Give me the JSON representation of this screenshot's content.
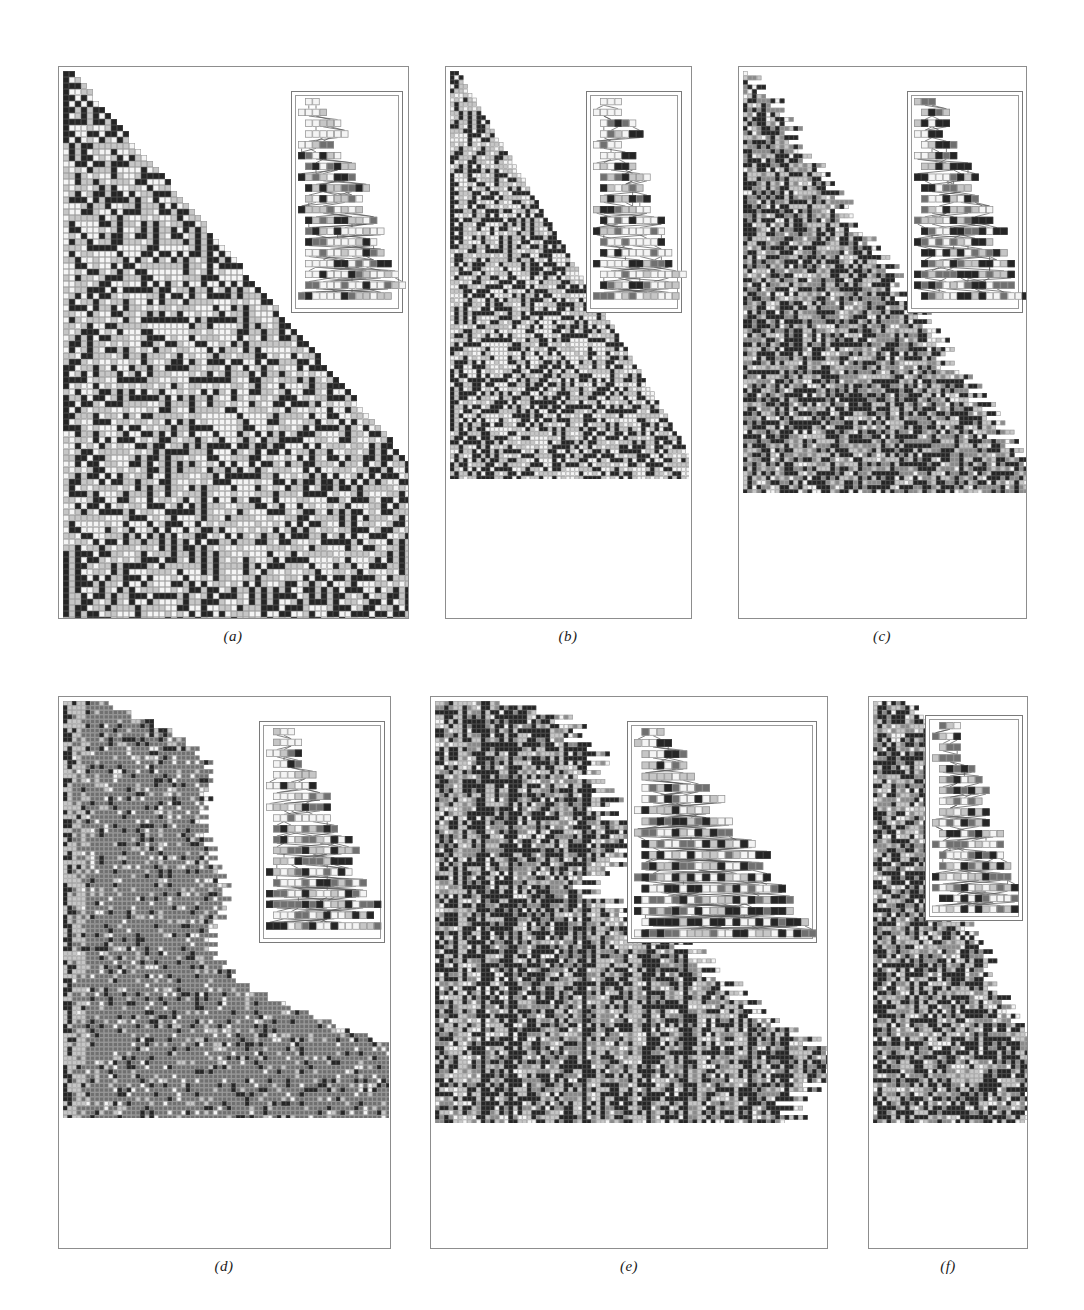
{
  "figure": {
    "background_color": "#ffffff",
    "panel_count": 6,
    "layout": "2 rows x 3 columns",
    "frame_color": "#8d8d8d"
  },
  "palette": {
    "state_white": "#f4f4f4",
    "state_light": "#c6c6c6",
    "state_mid": "#707070",
    "state_dark": "#8a8a8a",
    "state_black": "#252525",
    "cell_border": "#9e9e9e",
    "inset_link": "#5a5a5a"
  },
  "panels": [
    {
      "id": "a",
      "caption": "(a)",
      "x": 58,
      "y": 66,
      "w": 351,
      "h": 553,
      "grid": {
        "cols": 76,
        "rows": 92,
        "cell": 6.0,
        "origin_x": 4,
        "origin_y": 4
      },
      "boundary": "right-triangular",
      "slope": 0.6,
      "seed": 11731,
      "weights": {
        "white": 0.34,
        "light": 0.33,
        "black": 0.33
      },
      "structure": "nested-fractal",
      "inset": {
        "x": 232,
        "y": 24,
        "w": 112,
        "h": 222,
        "cols": 14,
        "rows": 19,
        "cell": 7.2,
        "seed": 4027,
        "links": true,
        "weights": {
          "white": 0.45,
          "light": 0.25,
          "mid": 0.15,
          "black": 0.15
        }
      }
    },
    {
      "id": "b",
      "caption": "(b)",
      "x": 445,
      "y": 66,
      "w": 247,
      "h": 553,
      "grid": {
        "cols": 54,
        "rows": 92,
        "cell": 4.45,
        "origin_x": 4,
        "origin_y": 4
      },
      "boundary": "right-triangular",
      "slope": 0.54,
      "seed": 22817,
      "weights": {
        "white": 0.33,
        "light": 0.34,
        "black": 0.33
      },
      "structure": "triangle-clusters",
      "inset": {
        "x": 140,
        "y": 24,
        "w": 96,
        "h": 222,
        "cols": 12,
        "rows": 19,
        "cell": 7.2,
        "seed": 5519,
        "links": true,
        "weights": {
          "white": 0.42,
          "light": 0.26,
          "mid": 0.16,
          "black": 0.16
        }
      }
    },
    {
      "id": "c",
      "caption": "(c)",
      "x": 738,
      "y": 66,
      "w": 289,
      "h": 553,
      "grid": {
        "cols": 62,
        "rows": 92,
        "cell": 4.6,
        "origin_x": 4,
        "origin_y": 4
      },
      "boundary": "ragged-triangular",
      "slope": 0.62,
      "seed": 33911,
      "weights": {
        "white": 0.1,
        "light": 0.22,
        "dark": 0.28,
        "black": 0.4
      },
      "structure": "dense-chaotic",
      "inset": {
        "x": 168,
        "y": 24,
        "w": 116,
        "h": 222,
        "cols": 15,
        "rows": 19,
        "cell": 7.2,
        "seed": 6203,
        "links": true,
        "weights": {
          "white": 0.22,
          "light": 0.24,
          "mid": 0.24,
          "black": 0.3
        }
      }
    },
    {
      "id": "d",
      "caption": "(d)",
      "x": 58,
      "y": 696,
      "w": 333,
      "h": 553,
      "grid": {
        "cols": 72,
        "rows": 92,
        "cell": 4.55,
        "origin_x": 4,
        "origin_y": 4
      },
      "boundary": "bulging-lobed",
      "slope": 0.72,
      "seed": 44013,
      "weights": {
        "white": 0.07,
        "light": 0.09,
        "mid": 0.72,
        "black": 0.12
      },
      "structure": "solid-gray-lobes",
      "inset": {
        "x": 200,
        "y": 24,
        "w": 126,
        "h": 222,
        "cols": 16,
        "rows": 19,
        "cell": 7.2,
        "seed": 7307,
        "links": true,
        "weights": {
          "white": 0.4,
          "light": 0.24,
          "mid": 0.18,
          "black": 0.18
        }
      }
    },
    {
      "id": "e",
      "caption": "(e)",
      "x": 430,
      "y": 696,
      "w": 398,
      "h": 553,
      "grid": {
        "cols": 86,
        "rows": 92,
        "cell": 4.6,
        "origin_x": 4,
        "origin_y": 4
      },
      "boundary": "ragged-columnar",
      "slope": 0.8,
      "seed": 55127,
      "weights": {
        "white": 0.13,
        "light": 0.21,
        "dark": 0.26,
        "black": 0.4
      },
      "structure": "vertical-striped-chaotic",
      "inset": {
        "x": 196,
        "y": 24,
        "w": 190,
        "h": 222,
        "cols": 24,
        "rows": 19,
        "cell": 7.6,
        "seed": 8419,
        "links": true,
        "weights": {
          "white": 0.26,
          "light": 0.24,
          "mid": 0.22,
          "black": 0.28
        }
      }
    },
    {
      "id": "f",
      "caption": "(f)",
      "x": 868,
      "y": 696,
      "w": 160,
      "h": 553,
      "grid": {
        "cols": 34,
        "rows": 92,
        "cell": 4.6,
        "origin_x": 4,
        "origin_y": 4
      },
      "boundary": "ragged-columnar",
      "slope": 0.92,
      "seed": 66229,
      "weights": {
        "white": 0.13,
        "light": 0.22,
        "dark": 0.25,
        "black": 0.4
      },
      "structure": "narrow-chaotic",
      "inset": {
        "x": 56,
        "y": 18,
        "w": 98,
        "h": 206,
        "cols": 12,
        "rows": 18,
        "cell": 7.2,
        "seed": 9533,
        "links": true,
        "weights": {
          "white": 0.24,
          "light": 0.26,
          "mid": 0.22,
          "black": 0.28
        }
      }
    }
  ],
  "captions": {
    "a": {
      "label": "(a)",
      "cx": 233,
      "y": 628
    },
    "b": {
      "label": "(b)",
      "cx": 568,
      "y": 628
    },
    "c": {
      "label": "(c)",
      "cx": 882,
      "y": 628
    },
    "d": {
      "label": "(d)",
      "cx": 224,
      "y": 1258
    },
    "e": {
      "label": "(e)",
      "cx": 629,
      "y": 1258
    },
    "f": {
      "label": "(f)",
      "cx": 948,
      "y": 1258
    }
  }
}
